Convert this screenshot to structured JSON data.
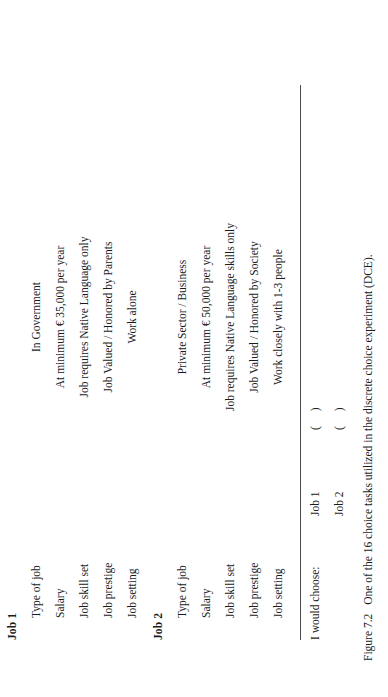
{
  "figure": {
    "number": "Figure 7.2",
    "caption": "One of the 16 choice tasks utilized in the discrete choice experiment (DCE)."
  },
  "choice_task": {
    "attribute_labels": [
      "Type of job",
      "Salary",
      "Job skill set",
      "Job prestige",
      "Job setting"
    ],
    "alternatives": [
      {
        "heading": "Job 1",
        "rows": [
          {
            "label": "Type of job",
            "value": "In Government"
          },
          {
            "label": "Salary",
            "value": "At minimum € 35,000 per year"
          },
          {
            "label": "Job skill set",
            "value": "Job  requires Native Language only"
          },
          {
            "label": "Job prestige",
            "value": "Job Valued / Honored by Parents"
          },
          {
            "label": "Job setting",
            "value": "Work alone"
          }
        ]
      },
      {
        "heading": "Job 2",
        "rows": [
          {
            "label": "Type of job",
            "value": "Private Sector / Business"
          },
          {
            "label": "Salary",
            "value": "At minimum € 50,000 per year"
          },
          {
            "label": "Job skill set",
            "value": "Job  requires Native Language skills only"
          },
          {
            "label": "Job prestige",
            "value": "Job Valued / Honored by Society"
          },
          {
            "label": "Job setting",
            "value": "Work closely with 1-3 people"
          }
        ]
      }
    ]
  },
  "answer": {
    "prompt": "I would choose:",
    "options": [
      {
        "label": "Job 1",
        "box": "(        )"
      },
      {
        "label": "Job 2",
        "box": "(        )"
      }
    ]
  },
  "colors": {
    "text": "#1b1b1b",
    "rule": "#4a4a4a",
    "background": "#ffffff"
  }
}
